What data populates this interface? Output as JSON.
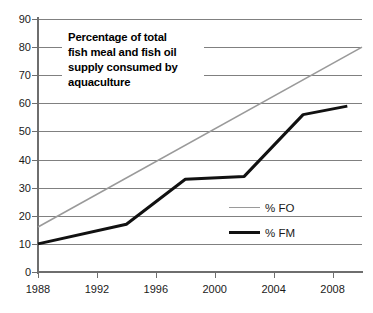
{
  "chart_data": {
    "type": "line",
    "title": "Percentage of total fish meal and fish oil supply consumed by aquaculture",
    "title_lines": [
      "Percentage of total",
      "fish meal and fish oil",
      "supply consumed by",
      "aquaculture"
    ],
    "xlabel": "",
    "ylabel": "",
    "xlim": [
      1988,
      2010
    ],
    "ylim": [
      0,
      90
    ],
    "grid": true,
    "legend_position": "inside-right",
    "y_ticks": [
      90,
      80,
      70,
      60,
      50,
      40,
      30,
      20,
      10,
      0
    ],
    "y_tick_labels": [
      "90",
      "80",
      "70",
      "60",
      "50",
      "40",
      "30",
      "20",
      "10",
      "0"
    ],
    "x_ticks": [
      1988,
      1992,
      1996,
      2000,
      2004,
      2008
    ],
    "x_tick_labels": [
      "1988",
      "1992",
      "1996",
      "2000",
      "2004",
      "2008"
    ],
    "series": [
      {
        "name": "% FO",
        "color": "#9a9a9a",
        "width": 1.6,
        "x": [
          1988,
          2010
        ],
        "values": [
          16,
          80
        ]
      },
      {
        "name": "% FM",
        "color": "#111111",
        "width": 3.0,
        "x": [
          1988,
          1994,
          1998,
          2002,
          2006,
          2009
        ],
        "values": [
          10,
          17,
          33,
          34,
          56,
          59
        ]
      }
    ]
  },
  "legend": {
    "items": [
      {
        "label": "% FO",
        "style": "fo"
      },
      {
        "label": "% FM",
        "style": "fm"
      }
    ]
  }
}
